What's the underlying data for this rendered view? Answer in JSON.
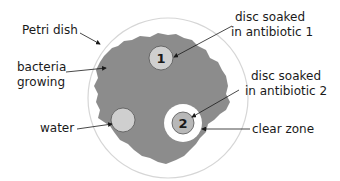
{
  "diagram": {
    "colors": {
      "dish_outline": "#d6d6d6",
      "bacteria": "#8c8c8c",
      "disc_fill": "#cfcfcf",
      "clear_zone": "#ffffff",
      "text": "#1a1a1a"
    },
    "labels": {
      "petri_dish": "Petri dish",
      "bacteria_line1": "bacteria",
      "bacteria_line2": "growing",
      "water": "water",
      "disc1_line1": "disc soaked",
      "disc1_line2": "in antibiotic 1",
      "disc2_line1": "disc soaked",
      "disc2_line2": "in antibiotic 2",
      "clear_zone": "clear zone"
    },
    "discs": {
      "disc1_number": "1",
      "disc2_number": "2"
    }
  }
}
